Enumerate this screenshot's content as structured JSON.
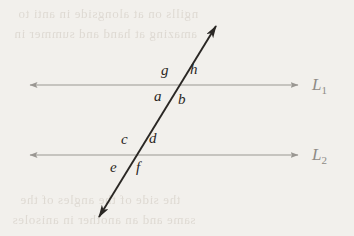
{
  "figure": {
    "background_color": "#f2f0ec",
    "ink_color": "#2a2724",
    "line_color": "#9a9792",
    "label_color": "#8f8b86",
    "lines": [
      {
        "name": "L1",
        "label": "L",
        "subscript": "1",
        "kind": "horizontal",
        "double_arrow": true,
        "x1": 28,
        "y1": 85,
        "x2": 300,
        "y2": 85,
        "label_x": 312,
        "label_y": 76
      },
      {
        "name": "L2",
        "label": "L",
        "subscript": "2",
        "kind": "horizontal",
        "double_arrow": true,
        "x1": 28,
        "y1": 155,
        "x2": 300,
        "y2": 155,
        "label_x": 312,
        "label_y": 146
      },
      {
        "name": "transversal",
        "label": "",
        "subscript": "",
        "kind": "transversal",
        "double_arrow": true,
        "x1": 219,
        "y1": 21,
        "x2": 96,
        "y2": 222,
        "label_x": 0,
        "label_y": 0
      }
    ],
    "intersections": [
      {
        "name": "intersection-L1",
        "x": 173,
        "y": 85
      },
      {
        "name": "intersection-L2",
        "x": 135,
        "y": 155
      }
    ],
    "angle_labels": [
      {
        "id": "g",
        "text": "g",
        "x": 161,
        "y": 63,
        "position": "upper-left-L1"
      },
      {
        "id": "h",
        "text": "h",
        "x": 190,
        "y": 62,
        "position": "upper-right-L1"
      },
      {
        "id": "a",
        "text": "a",
        "x": 154,
        "y": 89,
        "position": "lower-left-L1"
      },
      {
        "id": "b",
        "text": "b",
        "x": 178,
        "y": 92,
        "position": "lower-right-L1"
      },
      {
        "id": "c",
        "text": "c",
        "x": 121,
        "y": 132,
        "position": "upper-left-L2"
      },
      {
        "id": "d",
        "text": "d",
        "x": 149,
        "y": 131,
        "position": "upper-right-L2"
      },
      {
        "id": "e",
        "text": "e",
        "x": 110,
        "y": 160,
        "position": "lower-left-L2"
      },
      {
        "id": "f",
        "text": "f",
        "x": 136,
        "y": 160,
        "position": "lower-right-L2"
      }
    ]
  },
  "ghost_text": {
    "description": "Illegible faint show-through text from the reverse side of the page",
    "lines": [
      {
        "text": "ngills on at alongside in anti to",
        "x": 18,
        "y": 6,
        "size": 13
      },
      {
        "text": "amazing at hand and summer in",
        "x": 14,
        "y": 26,
        "size": 13
      },
      {
        "text": "the side of the angles of the",
        "x": 20,
        "y": 192,
        "size": 13
      },
      {
        "text": "same and an another in anisoles",
        "x": 12,
        "y": 212,
        "size": 13
      }
    ]
  }
}
